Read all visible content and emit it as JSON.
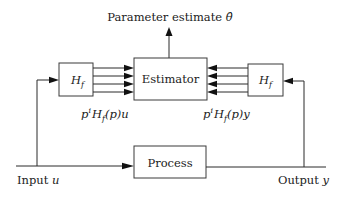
{
  "diagram": {
    "title": {
      "text": "Parameter estimate ",
      "symbol": "θ̂"
    },
    "blocks": {
      "estimator": {
        "label": "Estimator"
      },
      "filter_left": {
        "label_main": "H",
        "label_sub": "f"
      },
      "filter_right": {
        "label_main": "H",
        "label_sub": "f"
      },
      "process": {
        "label": "Process"
      }
    },
    "signals": {
      "filtered_input": {
        "p": "p",
        "sup": "i",
        "H": "H",
        "sub": "f",
        "arg": "(p)",
        "var": "u"
      },
      "filtered_output": {
        "p": "p",
        "sup": "i",
        "H": "H",
        "sub": "f",
        "arg": "(p)",
        "var": "y"
      },
      "input": {
        "text": "Input ",
        "var": "u"
      },
      "output": {
        "text": "Output ",
        "var": "y"
      }
    },
    "arrows_per_bundle": 4,
    "colors": {
      "line": "#2a2a2a",
      "box_border": "#3a3a3a",
      "text": "#222222",
      "background": "#ffffff"
    }
  }
}
